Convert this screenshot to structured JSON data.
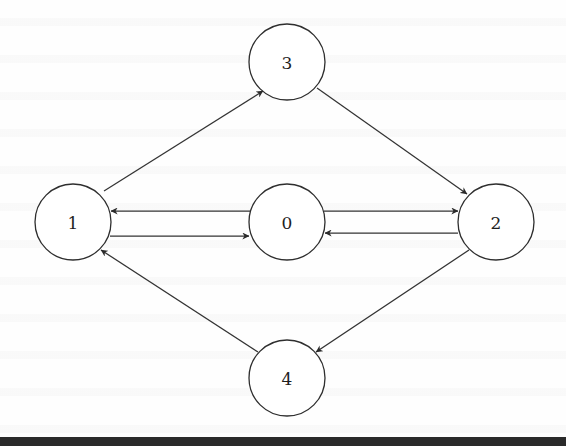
{
  "diagram": {
    "type": "directed-graph",
    "node_style": "circle",
    "colors": {
      "stroke": "#2e2e2e",
      "edge": "#333333",
      "label": "#1e1e1e",
      "background": "#ffffff",
      "bottom_rule": "#2a2a2a"
    },
    "nodes": [
      {
        "id": "0",
        "label": "0",
        "cx": 287,
        "cy": 222,
        "r": 38
      },
      {
        "id": "1",
        "label": "1",
        "cx": 73,
        "cy": 222,
        "r": 38
      },
      {
        "id": "2",
        "label": "2",
        "cx": 496,
        "cy": 222,
        "r": 38
      },
      {
        "id": "3",
        "label": "3",
        "cx": 287,
        "cy": 62,
        "r": 38
      },
      {
        "id": "4",
        "label": "4",
        "cx": 287,
        "cy": 378,
        "r": 38
      }
    ],
    "edges": [
      {
        "from": "1",
        "to": "3",
        "x1": 104,
        "y1": 191,
        "x2": 263,
        "y2": 91
      },
      {
        "from": "3",
        "to": "2",
        "x1": 317,
        "y1": 88,
        "x2": 467,
        "y2": 194
      },
      {
        "from": "0",
        "to": "1",
        "x1": 250,
        "y1": 211,
        "x2": 111,
        "y2": 211
      },
      {
        "from": "1",
        "to": "0",
        "x1": 110,
        "y1": 236,
        "x2": 249,
        "y2": 236
      },
      {
        "from": "0",
        "to": "2",
        "x1": 324,
        "y1": 211,
        "x2": 458,
        "y2": 211
      },
      {
        "from": "2",
        "to": "0",
        "x1": 458,
        "y1": 233,
        "x2": 325,
        "y2": 233
      },
      {
        "from": "2",
        "to": "4",
        "x1": 469,
        "y1": 250,
        "x2": 316,
        "y2": 352
      },
      {
        "from": "4",
        "to": "1",
        "x1": 258,
        "y1": 352,
        "x2": 101,
        "y2": 250
      }
    ]
  }
}
